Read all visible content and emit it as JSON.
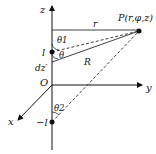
{
  "diagram": {
    "axes": {
      "z_label": "z",
      "y_label": "y",
      "x_label": "x",
      "origin_label": "O"
    },
    "point": {
      "label": "P(r,φ,z)"
    },
    "segments": {
      "r_label": "r",
      "R_label": "R"
    },
    "charges": {
      "top_label": "l",
      "bottom_label": "−l",
      "element_label": "dz′"
    },
    "angles": {
      "theta1": "θ1",
      "theta": "θ",
      "theta2": "θ2"
    }
  }
}
